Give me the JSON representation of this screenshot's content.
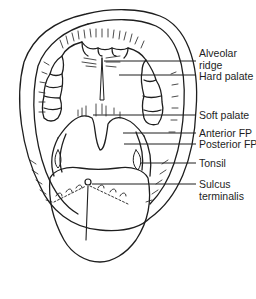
{
  "figure": {
    "labels": [
      {
        "id": "alveolar-ridge",
        "line1": "Alveolar",
        "line2": "ridge",
        "x": 199,
        "y": 47,
        "line_y": 61,
        "line_x1": 104
      },
      {
        "id": "hard-palate",
        "line1": "Hard palate",
        "line2": "",
        "x": 199,
        "y": 70,
        "line_y": 75,
        "line_x1": 119
      },
      {
        "id": "soft-palate",
        "line1": "Soft palate",
        "line2": "",
        "x": 199,
        "y": 109,
        "line_y": 115,
        "line_x1": 93
      },
      {
        "id": "anterior-fp",
        "line1": "Anterior FP",
        "line2": "",
        "x": 199,
        "y": 124,
        "line_y": 133,
        "line_x1": 123
      },
      {
        "id": "posterior-fp",
        "line1": "Posterior FP",
        "line2": "",
        "x": 199,
        "y": 137,
        "line_y": 144,
        "line_x1": 124
      },
      {
        "id": "tonsil",
        "line1": "Tonsil",
        "line2": "",
        "x": 199,
        "y": 154,
        "line_y": 163,
        "line_x1": 140
      },
      {
        "id": "sulcus-terminalis",
        "line1": "Sulcus",
        "line2": "terminalis",
        "x": 199,
        "y": 177,
        "line_y": 184,
        "line_x1": 92
      }
    ],
    "colors": {
      "ink": "#1e1e1e",
      "background": "#ffffff"
    }
  }
}
